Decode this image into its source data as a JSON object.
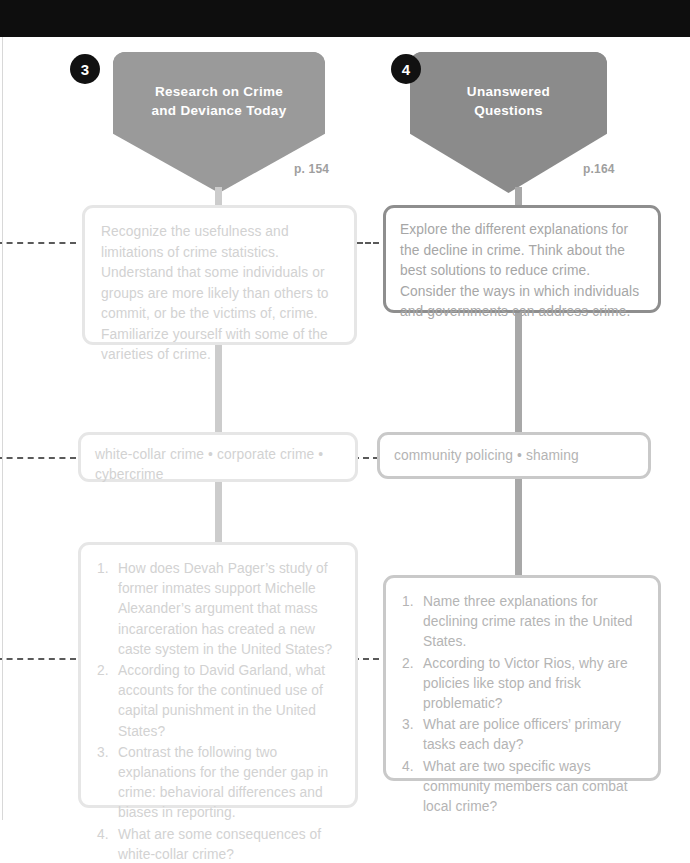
{
  "page": {
    "background_color": "#ffffff",
    "top_band_color": "#0e0e0e"
  },
  "columns": [
    {
      "id": "col-3",
      "badge": "3",
      "title": "Research on Crime\nand Deviance Today",
      "title_line1": "Research on Crime",
      "title_line2": "and Deviance Today",
      "page_ref": "p. 154",
      "shield_color": "#9a9a9a",
      "objective": "Recognize the usefulness and limitations of crime statistics. Understand that some individuals or groups are more likely than others to commit, or be the victims of, crime. Familiarize yourself with some of the varieties of crime.",
      "keywords": "white-collar crime • corporate crime • cybercrime",
      "questions": [
        {
          "num": "1.",
          "text": "How does Devah Pager’s study of former inmates support Michelle Alexander’s argument that mass incarceration has created a new caste system in the United States?"
        },
        {
          "num": "2.",
          "text": "According to David Garland, what accounts for the continued use of capital punishment in the United States?"
        },
        {
          "num": "3.",
          "text": "Contrast the following two explanations for the gender gap in crime: behavioral differences and biases in reporting."
        },
        {
          "num": "4.",
          "text": "What are some consequences of white-collar crime?"
        }
      ]
    },
    {
      "id": "col-4",
      "badge": "4",
      "title": "Unanswered\nQuestions",
      "title_line1": "Unanswered",
      "title_line2": "Questions",
      "page_ref": "p.164",
      "shield_color": "#8b8b8b",
      "objective": "Explore the different explanations for the decline in crime. Think about the best solutions to reduce crime. Consider the ways in which individuals and governments can address crime.",
      "keywords": "community policing • shaming",
      "questions": [
        {
          "num": "1.",
          "text": "Name three explanations for declining crime rates in the United States."
        },
        {
          "num": "2.",
          "text": "According to Victor Rios, why are policies like stop and frisk problematic?"
        },
        {
          "num": "3.",
          "text": "What are police officers’ primary tasks each day?"
        },
        {
          "num": "4.",
          "text": "What are two specific ways community members can combat local crime?"
        }
      ]
    }
  ]
}
